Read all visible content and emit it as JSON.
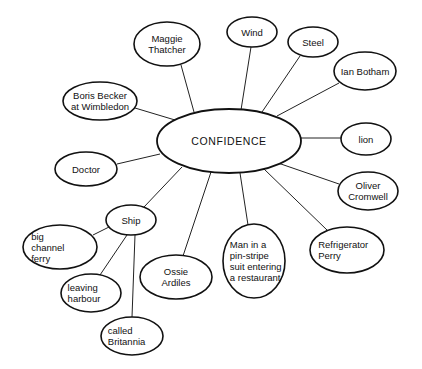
{
  "diagram": {
    "type": "mind-map",
    "center": {
      "id": "confidence",
      "label": "CONFIDENCE",
      "cx": 229,
      "cy": 141,
      "rx": 72,
      "ry": 32
    },
    "nodes": [
      {
        "id": "maggie-thatcher",
        "lines": [
          "Maggie",
          "Thatcher"
        ],
        "cx": 167,
        "cy": 44,
        "rx": 33,
        "ry": 22,
        "parent": "confidence",
        "align": "middle"
      },
      {
        "id": "wind",
        "lines": [
          "Wind"
        ],
        "cx": 252,
        "cy": 32,
        "rx": 25,
        "ry": 15,
        "parent": "confidence",
        "align": "middle"
      },
      {
        "id": "steel",
        "lines": [
          "Steel"
        ],
        "cx": 313,
        "cy": 42,
        "rx": 25,
        "ry": 15,
        "parent": "confidence",
        "align": "middle"
      },
      {
        "id": "ian-botham",
        "lines": [
          "Ian Botham"
        ],
        "cx": 365,
        "cy": 71,
        "rx": 31,
        "ry": 19,
        "parent": "confidence",
        "align": "middle"
      },
      {
        "id": "boris-becker",
        "lines": [
          "Boris Becker",
          "at Wimbledon"
        ],
        "cx": 100,
        "cy": 101,
        "rx": 37,
        "ry": 19,
        "parent": "confidence",
        "align": "middle"
      },
      {
        "id": "lion",
        "lines": [
          "lion"
        ],
        "cx": 366,
        "cy": 139,
        "rx": 25,
        "ry": 16,
        "parent": "confidence",
        "align": "middle"
      },
      {
        "id": "doctor",
        "lines": [
          "Doctor"
        ],
        "cx": 86,
        "cy": 169,
        "rx": 31,
        "ry": 17,
        "parent": "confidence",
        "align": "middle"
      },
      {
        "id": "oliver-cromwell",
        "lines": [
          "Oliver",
          "Cromwell"
        ],
        "cx": 368,
        "cy": 191,
        "rx": 30,
        "ry": 19,
        "parent": "confidence",
        "align": "middle"
      },
      {
        "id": "ship",
        "lines": [
          "Ship"
        ],
        "cx": 131,
        "cy": 220,
        "rx": 25,
        "ry": 15,
        "parent": "confidence",
        "align": "middle"
      },
      {
        "id": "refrigerator-perry",
        "lines": [
          "Refrigerator",
          "Perry"
        ],
        "cx": 347,
        "cy": 250,
        "rx": 37,
        "ry": 23,
        "parent": "confidence",
        "align": "start"
      },
      {
        "id": "man-pin-stripe",
        "lines": [
          "Man in a",
          "pin-stripe",
          "suit entering",
          "a restaurant"
        ],
        "cx": 254,
        "cy": 261,
        "rx": 31,
        "ry": 37,
        "parent": "confidence",
        "align": "start"
      },
      {
        "id": "ossie-ardiles",
        "lines": [
          "Ossie",
          "Ardiles"
        ],
        "cx": 176,
        "cy": 277,
        "rx": 36,
        "ry": 22,
        "parent": "confidence",
        "align": "middle"
      },
      {
        "id": "big-channel-ferry",
        "lines": [
          "big",
          "channel",
          "ferry"
        ],
        "cx": 60,
        "cy": 247,
        "rx": 37,
        "ry": 22,
        "parent": "ship",
        "align": "start"
      },
      {
        "id": "leaving-harbour",
        "lines": [
          "leaving",
          "harbour"
        ],
        "cx": 91,
        "cy": 293,
        "rx": 30,
        "ry": 19,
        "parent": "ship",
        "align": "start"
      },
      {
        "id": "called-britannia",
        "lines": [
          "called",
          "Britannia"
        ],
        "cx": 132,
        "cy": 336,
        "rx": 31,
        "ry": 19,
        "parent": "ship",
        "align": "start"
      }
    ],
    "edges": [
      {
        "from": "confidence",
        "to": "maggie-thatcher",
        "x1": 194,
        "y1": 112,
        "x2": 181,
        "y2": 65
      },
      {
        "from": "confidence",
        "to": "wind",
        "x1": 241,
        "y1": 110,
        "x2": 251,
        "y2": 47
      },
      {
        "from": "confidence",
        "to": "steel",
        "x1": 262,
        "y1": 112,
        "x2": 300,
        "y2": 56
      },
      {
        "from": "confidence",
        "to": "ian-botham",
        "x1": 277,
        "y1": 116,
        "x2": 339,
        "y2": 83
      },
      {
        "from": "confidence",
        "to": "boris-becker",
        "x1": 175,
        "y1": 120,
        "x2": 135,
        "y2": 108
      },
      {
        "from": "confidence",
        "to": "lion",
        "x1": 301,
        "y1": 138,
        "x2": 341,
        "y2": 138
      },
      {
        "from": "confidence",
        "to": "doctor",
        "x1": 160,
        "y1": 154,
        "x2": 117,
        "y2": 164
      },
      {
        "from": "confidence",
        "to": "oliver-cromwell",
        "x1": 278,
        "y1": 163,
        "x2": 339,
        "y2": 184
      },
      {
        "from": "confidence",
        "to": "ship",
        "x1": 182,
        "y1": 167,
        "x2": 144,
        "y2": 207
      },
      {
        "from": "confidence",
        "to": "refrigerator-perry",
        "x1": 264,
        "y1": 169,
        "x2": 327,
        "y2": 230
      },
      {
        "from": "confidence",
        "to": "man-pin-stripe",
        "x1": 240,
        "y1": 173,
        "x2": 248,
        "y2": 225
      },
      {
        "from": "confidence",
        "to": "ossie-ardiles",
        "x1": 211,
        "y1": 172,
        "x2": 183,
        "y2": 256
      },
      {
        "from": "ship",
        "to": "big-channel-ferry",
        "x1": 109,
        "y1": 227,
        "x2": 93,
        "y2": 235
      },
      {
        "from": "ship",
        "to": "leaving-harbour",
        "x1": 127,
        "y1": 235,
        "x2": 100,
        "y2": 275
      },
      {
        "from": "ship",
        "to": "called-britannia",
        "x1": 135,
        "y1": 235,
        "x2": 132,
        "y2": 317
      }
    ]
  }
}
